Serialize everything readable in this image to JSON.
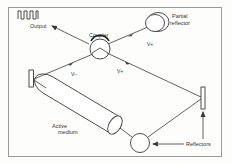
{
  "diagram": {
    "colors": {
      "background": "#fdfdfc",
      "border": "#9a9a9a",
      "stroke": "#3a3a3a",
      "text": "#333333"
    },
    "labels": {
      "output": "Output",
      "coupler": "Coupler",
      "partial_reflector_line1": "Partial",
      "partial_reflector_line2": "reflector",
      "v_plus_top": "V+",
      "v_minus": "V−",
      "v_plus_bottom": "V+",
      "active_medium_line1": "Active",
      "active_medium_line2": "medium",
      "reflectors": "Reflectors"
    },
    "components": [
      {
        "id": "output-signal",
        "icon": "square-wave-icon"
      },
      {
        "id": "coupler",
        "shape": "circle"
      },
      {
        "id": "partial-reflector",
        "shape": "disk"
      },
      {
        "id": "left-reflector",
        "shape": "rectangle"
      },
      {
        "id": "active-medium",
        "shape": "cylinder"
      },
      {
        "id": "bottom-reflector",
        "shape": "circle"
      },
      {
        "id": "right-reflector",
        "shape": "rectangle"
      }
    ]
  }
}
